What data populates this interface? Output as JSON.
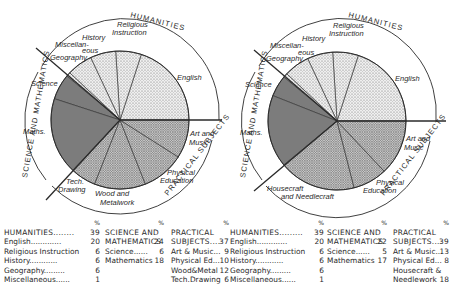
{
  "chart_data": [
    {
      "type": "pie",
      "title": "Left diagram",
      "center": [
        120,
        120
      ],
      "radius": 69,
      "groups": [
        {
          "name": "HUMANITIES",
          "total": 39,
          "pattern": "light",
          "items": [
            {
              "label": "English",
              "value": 20
            },
            {
              "label": "Religious Instruction",
              "value": 6
            },
            {
              "label": "History",
              "value": 6
            },
            {
              "label": "Geography",
              "value": 6
            },
            {
              "label": "Miscellaneous",
              "value": 1
            }
          ]
        },
        {
          "name": "SCIENCE AND MATHEMATICS",
          "total": 24,
          "pattern": "dark",
          "items": [
            {
              "label": "Science",
              "value": 6
            },
            {
              "label": "Mathematics",
              "value": 18
            }
          ]
        },
        {
          "name": "PRACTICAL SUBJECTS",
          "total": 37,
          "pattern": "medium",
          "items": [
            {
              "label": "Tech.Drawing",
              "value": 6
            },
            {
              "label": "Wood&Metal",
              "value": 12
            },
            {
              "label": "Physical Ed.",
              "value": 10
            },
            {
              "label": "Art & Music",
              "value": 9
            }
          ]
        }
      ]
    },
    {
      "type": "pie",
      "title": "Right diagram",
      "center": [
        337,
        121
      ],
      "radius": 69,
      "groups": [
        {
          "name": "HUMANITIES",
          "total": 39,
          "pattern": "light",
          "items": [
            {
              "label": "English",
              "value": 20
            },
            {
              "label": "Religious Instruction",
              "value": 6
            },
            {
              "label": "History",
              "value": 6
            },
            {
              "label": "Geography",
              "value": 6
            },
            {
              "label": "Miscellaneous",
              "value": 1
            }
          ]
        },
        {
          "name": "SCIENCE AND MATHEMATICS",
          "total": 22,
          "pattern": "dark",
          "items": [
            {
              "label": "Science",
              "value": 5
            },
            {
              "label": "Mathematics",
              "value": 17
            }
          ]
        },
        {
          "name": "PRACTICAL SUBJECTS",
          "total": 39,
          "pattern": "medium",
          "items": [
            {
              "label": "Housecraft & Needlework",
              "value": 18
            },
            {
              "label": "Physical Ed.",
              "value": 8
            },
            {
              "label": "Art & Music",
              "value": 13
            }
          ]
        }
      ]
    }
  ],
  "diagram_labels": {
    "left": {
      "humanities": "HUMANITIES",
      "science": "SCIENCE AND MATHEMATICS",
      "practical": "PRACTICAL SUBJECTS",
      "english": "English",
      "religious_1": "Religious",
      "religious_2": "Instruction",
      "history": "History",
      "misc_1": "Miscellan-",
      "misc_2": "eous",
      "geography": "Geography",
      "science_slice": "Science",
      "maths": "Maths.",
      "tech_1": "Tech.",
      "tech_2": "Drawing",
      "wood_1": "Wood and",
      "wood_2": "Metalwork",
      "pe_1": "Physical",
      "pe_2": "Education",
      "art_1": "Art and",
      "art_2": "Music"
    },
    "right": {
      "humanities": "HUMANITIES",
      "science": "SCIENCE AND MATHEMATICS",
      "practical": "PRACTICAL SUBJECTS",
      "english": "English",
      "religious_1": "Religious",
      "religious_2": "Instruction",
      "history": "History",
      "misc_1": "Miscellan-",
      "misc_2": "eous",
      "geography": "Geography",
      "science_slice": "Science",
      "maths": "Maths.",
      "house_1": "Housecraft",
      "house_2": "and Needlecraft",
      "pe_1": "Physical",
      "pe_2": "Education",
      "art_1": "Art and",
      "art_2": "Music"
    }
  },
  "tables": {
    "percent_sign": "%",
    "left": {
      "humanities": [
        {
          "label": "HUMANITIES........",
          "value": "39"
        },
        {
          "label": "English.............",
          "value": "20"
        },
        {
          "label": "Religious Instruction",
          "value": "6"
        },
        {
          "label": "History............",
          "value": "6"
        },
        {
          "label": "Geography.........",
          "value": "6"
        },
        {
          "label": "Miscellaneous......",
          "value": "1"
        }
      ],
      "science": [
        {
          "label": "SCIENCE AND",
          "value": ""
        },
        {
          "label": "MATHEMATICS",
          "value": "24"
        },
        {
          "label": "Science......",
          "value": "6"
        },
        {
          "label": "Mathematics",
          "value": "18"
        }
      ],
      "practical": [
        {
          "label": "PRACTICAL",
          "value": ""
        },
        {
          "label": "SUBJECTS....",
          "value": "37"
        },
        {
          "label": "Art & Music...",
          "value": "9"
        },
        {
          "label": "Physical Ed...",
          "value": "10"
        },
        {
          "label": "Wood&Metal",
          "value": "12"
        },
        {
          "label": "Tech.Drawing",
          "value": "6"
        }
      ]
    },
    "right": {
      "humanities": [
        {
          "label": "HUMANITIES.........",
          "value": "39"
        },
        {
          "label": "English.............",
          "value": "20"
        },
        {
          "label": "Religious Instruction",
          "value": "6"
        },
        {
          "label": "History............",
          "value": "6"
        },
        {
          "label": "Geography.........",
          "value": "6"
        },
        {
          "label": "Miscellaneous......",
          "value": "1"
        }
      ],
      "science": [
        {
          "label": "SCIENCE AND",
          "value": ""
        },
        {
          "label": "MATHEMATICS",
          "value": "22"
        },
        {
          "label": "Science......",
          "value": "5"
        },
        {
          "label": "Mathematics",
          "value": "17"
        }
      ],
      "practical": [
        {
          "label": "PRACTICAL",
          "value": ""
        },
        {
          "label": "SUBJECTS....",
          "value": "39"
        },
        {
          "label": "Art & Music...",
          "value": "13"
        },
        {
          "label": "Physical Ed...",
          "value": "8"
        },
        {
          "label": "Housecraft &",
          "value": ""
        },
        {
          "label": "Needlework",
          "value": "18"
        }
      ]
    }
  },
  "colors": {
    "ink": "#2a2a2a",
    "light_fill": "#dcdcdc",
    "medium_fill": "#b9b9b9",
    "dark_fill": "#a2a2a2",
    "background": "#ffffff"
  }
}
